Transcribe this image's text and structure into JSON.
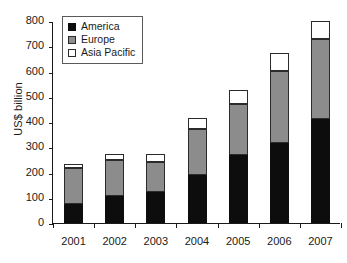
{
  "chart_data": {
    "type": "bar",
    "stacked": true,
    "title": "",
    "xlabel": "",
    "ylabel": "US$ billion",
    "ylim": [
      0,
      800
    ],
    "yticks": [
      0,
      100,
      200,
      300,
      400,
      500,
      600,
      700,
      800
    ],
    "grid": false,
    "legend_position": "top-left",
    "categories": [
      "2001",
      "2002",
      "2003",
      "2004",
      "2005",
      "2006",
      "2007"
    ],
    "series": [
      {
        "name": "America",
        "color": "#0d0d0d",
        "values": [
          77,
          107,
          122,
          190,
          269,
          317,
          412
        ]
      },
      {
        "name": "Europe",
        "color": "#8c8c8c",
        "values": [
          141,
          142,
          119,
          182,
          202,
          285,
          316
        ]
      },
      {
        "name": "Asia Pacific",
        "color": "#ffffff",
        "values": [
          17,
          24,
          32,
          44,
          56,
          71,
          72
        ]
      }
    ],
    "totals": [
      235,
      273,
      273,
      416,
      527,
      673,
      800
    ]
  }
}
